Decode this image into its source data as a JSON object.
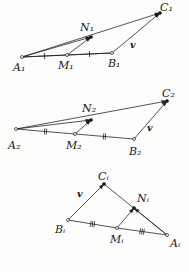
{
  "figure": {
    "background_color": "#fdfdfc",
    "stroke_color": "#1a1a1a",
    "panels": [
      {
        "id": "panel-1",
        "index_label": "1",
        "vertex_labels": {
          "A": "A₁",
          "B": "B₁",
          "C": "C₁",
          "M": "M₁",
          "N": "N₁"
        },
        "vector_label": "v",
        "tick_count": 1,
        "points": {
          "A": [
            22,
            57
          ],
          "B": [
            112,
            53
          ],
          "C": [
            160,
            13
          ],
          "M": [
            67,
            55
          ],
          "N": [
            91,
            37
          ]
        },
        "labels": {
          "A": [
            13,
            62
          ],
          "B": [
            108,
            58
          ],
          "C": [
            160,
            2
          ],
          "M": [
            58,
            60
          ],
          "N": [
            80,
            22
          ],
          "v": [
            130,
            40
          ]
        },
        "open_dots": [
          "A",
          "B",
          "M"
        ],
        "filled_dots": [
          "C",
          "N"
        ],
        "arrows": [
          {
            "from": "A",
            "to": "C",
            "head": true
          },
          {
            "from": "A",
            "to": "N",
            "head": true
          },
          {
            "from": "M",
            "to": "N",
            "head": true
          },
          {
            "from": "B",
            "to": "C",
            "head": true
          }
        ],
        "plain_segments": [
          {
            "from": "A",
            "to": "B"
          }
        ],
        "tick_segments": [
          {
            "from": "A",
            "to": "M",
            "count": 1
          },
          {
            "from": "M",
            "to": "B",
            "count": 1
          }
        ]
      },
      {
        "id": "panel-2",
        "index_label": "2",
        "vertex_labels": {
          "A": "A₂",
          "B": "B₂",
          "C": "C₂",
          "M": "M₂",
          "N": "N₂"
        },
        "vector_label": "v",
        "tick_count": 2,
        "points": {
          "A": [
            16,
            129
          ],
          "B": [
            134,
            139
          ],
          "C": [
            167,
            101
          ],
          "M": [
            75,
            134
          ],
          "N": [
            91,
            120
          ]
        },
        "labels": {
          "A": [
            8,
            140
          ],
          "B": [
            129,
            146
          ],
          "C": [
            162,
            88
          ],
          "M": [
            66,
            140
          ],
          "N": [
            82,
            103
          ],
          "v": [
            147,
            123
          ]
        },
        "open_dots": [
          "A",
          "B",
          "M"
        ],
        "filled_dots": [
          "C",
          "N"
        ],
        "arrows": [
          {
            "from": "A",
            "to": "C",
            "head": true
          },
          {
            "from": "A",
            "to": "N",
            "head": true
          },
          {
            "from": "M",
            "to": "N",
            "head": true
          },
          {
            "from": "B",
            "to": "C",
            "head": true
          }
        ],
        "plain_segments": [],
        "tick_segments": [
          {
            "from": "A",
            "to": "M",
            "count": 2
          },
          {
            "from": "M",
            "to": "B",
            "count": 2
          }
        ]
      },
      {
        "id": "panel-3",
        "index_label": "i",
        "vertex_labels": {
          "A": "Aᵢ",
          "B": "Bᵢ",
          "C": "Cᵢ",
          "M": "Mᵢ",
          "N": "Nᵢ"
        },
        "vector_label": "v",
        "tick_count": 3,
        "points": {
          "A": [
            167,
            235
          ],
          "B": [
            68,
            220
          ],
          "C": [
            104,
            184
          ],
          "M": [
            117,
            228
          ],
          "N": [
            134,
            208
          ]
        },
        "labels": {
          "A": [
            170,
            238
          ],
          "B": [
            55,
            224
          ],
          "C": [
            98,
            171
          ],
          "M": [
            110,
            234
          ],
          "N": [
            137,
            193
          ],
          "v": [
            77,
            189
          ]
        },
        "open_dots": [
          "A",
          "B",
          "M"
        ],
        "filled_dots": [
          "C",
          "N"
        ],
        "arrows": [
          {
            "from": "B",
            "to": "C",
            "head": true
          },
          {
            "from": "A",
            "to": "C",
            "head": false
          },
          {
            "from": "A",
            "to": "N",
            "head": true
          },
          {
            "from": "M",
            "to": "N",
            "head": true
          }
        ],
        "plain_segments": [],
        "tick_segments": [
          {
            "from": "B",
            "to": "M",
            "count": 3
          },
          {
            "from": "M",
            "to": "A",
            "count": 3
          }
        ]
      }
    ]
  }
}
